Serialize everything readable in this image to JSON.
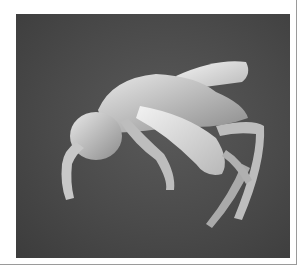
{
  "image": {
    "subject": "scanning electron micrograph of a small wasp",
    "background_color": "#4a4a4a",
    "subject_color": "#d9d9d9",
    "frame_color": "#9a9a9a"
  }
}
